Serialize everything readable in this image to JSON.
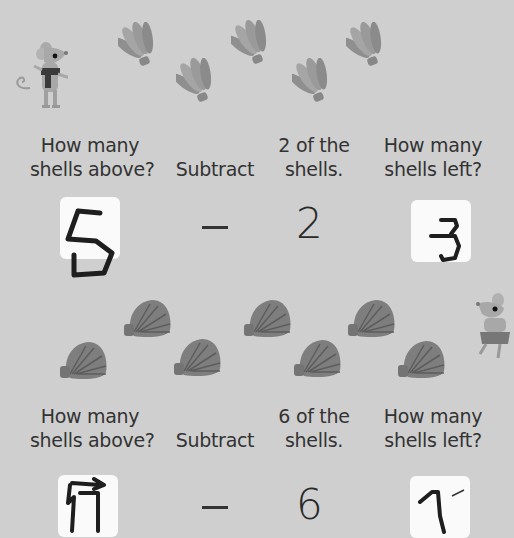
{
  "worksheet": {
    "problem1": {
      "shell_count_shown": 5,
      "shell_type": "fan-shell",
      "labels": {
        "col1": [
          "How many",
          "shells above?"
        ],
        "col2": "Subtract",
        "col3": [
          "2 of the",
          "shells."
        ],
        "col4": [
          "How many",
          "shells left?"
        ]
      },
      "operator": "–",
      "subtrahend": "2",
      "answer_box_1_handwritten": "5",
      "answer_box_2_handwritten": "3"
    },
    "problem2": {
      "shell_count_shown": 7,
      "shell_type": "clam-shell",
      "labels": {
        "col1": [
          "How many",
          "shells above?"
        ],
        "col2": "Subtract",
        "col3": [
          "6 of the",
          "shells."
        ],
        "col4": [
          "How many",
          "shells left?"
        ]
      },
      "operator": "–",
      "subtrahend": "6",
      "answer_box_1_handwritten": "7",
      "answer_box_2_handwritten": "1"
    },
    "colors": {
      "background": "#cfcfcf",
      "text": "#333333",
      "box": "#fafafa",
      "shell": "#8a8a8a",
      "ink": "#1e1e1e"
    }
  }
}
